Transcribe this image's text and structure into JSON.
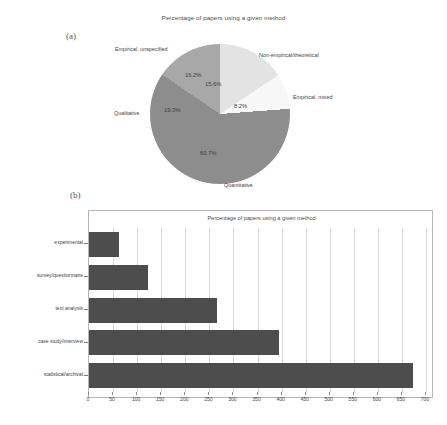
{
  "figure": {
    "panel_a_letter": "(a)",
    "panel_b_letter": "(b)"
  },
  "chart_data": [
    {
      "type": "pie",
      "title": "Percentage of papers using a given method",
      "labels": [
        "Non-empirical/theoretical",
        "Empirical, mixed",
        "Quantitative",
        "Qualitative",
        "Empirical, unspecified"
      ],
      "values": [
        15.6,
        8.2,
        60.7,
        19.3,
        16.2
      ],
      "value_labels": [
        "15.6%",
        "8.2%",
        "60.7%",
        "19.3%",
        "16.2%"
      ],
      "colors": [
        "#e3e3e3",
        "#f7f7f7",
        "#8d8d8d",
        "#a8a8a8",
        "#c9c9c9"
      ],
      "legend": "none",
      "grid": false
    },
    {
      "type": "bar",
      "orientation": "horizontal",
      "title": "Percentage of papers using a given method",
      "categories": [
        "experimental",
        "survey/questionnaire",
        "text analysis",
        "case study/interview",
        "statistical/archival"
      ],
      "values": [
        62,
        123,
        265,
        395,
        672
      ],
      "xlabel": "",
      "ylabel": "",
      "xlim": [
        0,
        700
      ],
      "xticks": [
        0,
        50,
        100,
        150,
        200,
        250,
        300,
        350,
        400,
        450,
        500,
        550,
        600,
        650,
        700
      ],
      "bar_color": "#4d4d4d",
      "grid": true
    }
  ]
}
